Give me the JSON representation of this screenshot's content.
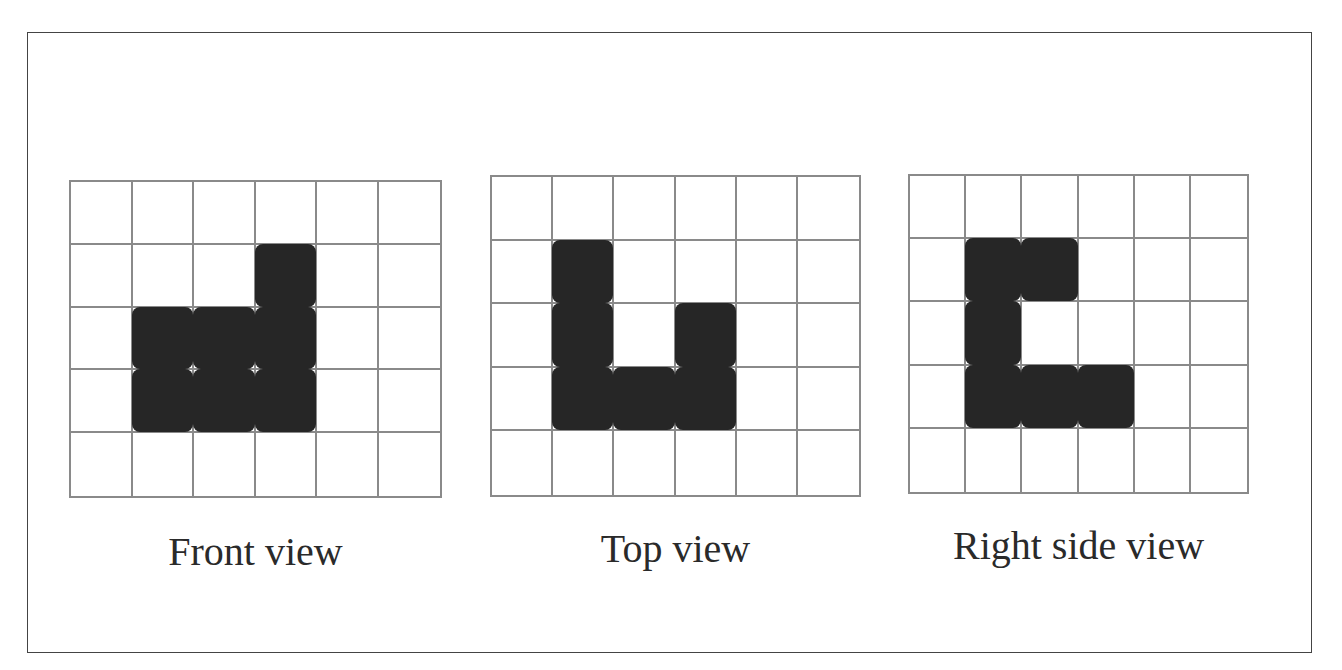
{
  "figure": {
    "views": [
      {
        "id": "front",
        "label": "Front view",
        "cols": 6,
        "rows": 5,
        "filled": [
          [
            1,
            3
          ],
          [
            2,
            1
          ],
          [
            2,
            2
          ],
          [
            2,
            3
          ],
          [
            3,
            1
          ],
          [
            3,
            2
          ],
          [
            3,
            3
          ]
        ]
      },
      {
        "id": "top",
        "label": "Top view",
        "cols": 6,
        "rows": 5,
        "filled": [
          [
            1,
            1
          ],
          [
            2,
            1
          ],
          [
            2,
            3
          ],
          [
            3,
            1
          ],
          [
            3,
            2
          ],
          [
            3,
            3
          ]
        ]
      },
      {
        "id": "right",
        "label": "Right side view",
        "cols": 6,
        "rows": 5,
        "filled": [
          [
            1,
            1
          ],
          [
            1,
            2
          ],
          [
            2,
            1
          ],
          [
            3,
            1
          ],
          [
            3,
            2
          ],
          [
            3,
            3
          ]
        ]
      }
    ]
  },
  "colors": {
    "grid_line": "#8a8a8a",
    "fill": "#262626",
    "frame": "#444444",
    "text": "#2a2a2a"
  }
}
